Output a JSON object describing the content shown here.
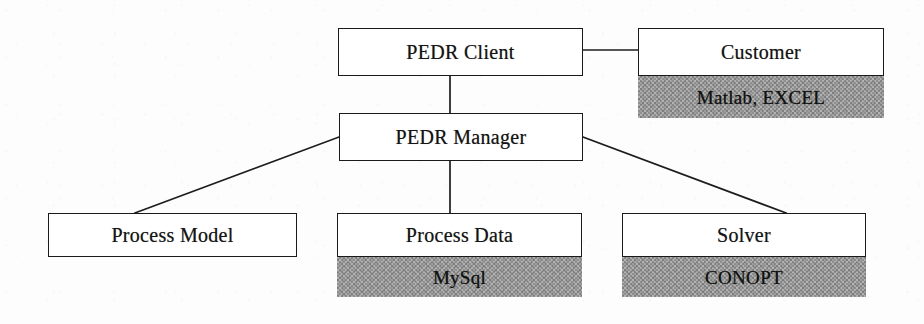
{
  "diagram": {
    "background_color": "#ffffff",
    "line_color": "#1d1d1d",
    "shade_color": "#d8d8d8",
    "nodes": [
      {
        "id": "pedr-client",
        "label": "PEDR Client",
        "sub_label": null,
        "x": 338,
        "y": 28,
        "w": 245,
        "h": 48,
        "sub_h": 0
      },
      {
        "id": "customer",
        "label": "Customer",
        "sub_label": "Matlab, EXCEL",
        "x": 638,
        "y": 28,
        "w": 246,
        "h": 48,
        "sub_h": 42
      },
      {
        "id": "pedr-manager",
        "label": "PEDR Manager",
        "sub_label": null,
        "x": 339,
        "y": 113,
        "w": 244,
        "h": 48,
        "sub_h": 0
      },
      {
        "id": "process-model",
        "label": "Process Model",
        "sub_label": null,
        "x": 48,
        "y": 213,
        "w": 249,
        "h": 44,
        "sub_h": 0
      },
      {
        "id": "process-data",
        "label": "Process Data",
        "sub_label": "MySql",
        "x": 337,
        "y": 213,
        "w": 245,
        "h": 44,
        "sub_h": 40
      },
      {
        "id": "solver",
        "label": "Solver",
        "sub_label": "CONOPT",
        "x": 622,
        "y": 213,
        "w": 244,
        "h": 44,
        "sub_h": 40
      }
    ],
    "edges": [
      {
        "id": "client-to-customer",
        "from": "pedr-client",
        "to": "customer",
        "path": "M 583 50 L 638 50"
      },
      {
        "id": "client-to-manager",
        "from": "pedr-client",
        "to": "pedr-manager",
        "path": "M 450 76 L 450 113"
      },
      {
        "id": "manager-to-process-model",
        "from": "pedr-manager",
        "to": "process-model",
        "path": "M 339 137 L 135 213"
      },
      {
        "id": "manager-to-process-data",
        "from": "pedr-manager",
        "to": "process-data",
        "path": "M 450 161 L 450 213"
      },
      {
        "id": "manager-to-solver",
        "from": "pedr-manager",
        "to": "solver",
        "path": "M 583 137 L 786 213"
      }
    ]
  }
}
